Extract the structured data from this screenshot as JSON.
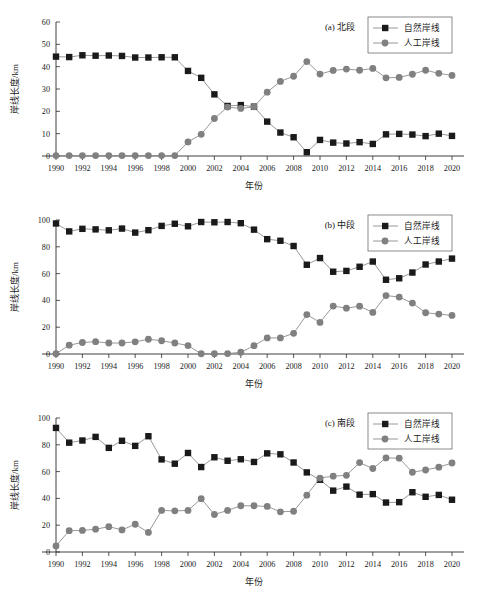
{
  "figure": {
    "panel_count": 3,
    "x_axis_title": "年份",
    "y_axis_title": "岸线长度/km",
    "legend": {
      "natural_label": "自然岸线",
      "artificial_label": "人工岸线",
      "natural_color": "#1a1a1a",
      "artificial_color": "#808080",
      "line_color": "#8c8c8c"
    }
  },
  "chart_data": [
    {
      "type": "line",
      "title": "(a) 北段",
      "xlabel": "年份",
      "ylabel": "岸线长度/km",
      "ylim": [
        0,
        60
      ],
      "yticks": [
        0,
        10,
        20,
        30,
        40,
        50,
        60
      ],
      "xlim": [
        1990,
        2020
      ],
      "xticks": [
        1990,
        1992,
        1994,
        1996,
        1998,
        2000,
        2002,
        2004,
        2006,
        2008,
        2010,
        2012,
        2014,
        2016,
        2018,
        2020
      ],
      "grid": false,
      "legend_position": "top-right",
      "x": [
        1990,
        1991,
        1992,
        1993,
        1994,
        1995,
        1996,
        1997,
        1998,
        1999,
        2000,
        2001,
        2002,
        2003,
        2004,
        2005,
        2006,
        2007,
        2008,
        2009,
        2010,
        2011,
        2012,
        2013,
        2014,
        2015,
        2016,
        2017,
        2018,
        2019,
        2020
      ],
      "series": [
        {
          "name": "自然岸线",
          "marker": "square",
          "values": [
            44.5,
            44.3,
            45.1,
            44.9,
            45.0,
            44.8,
            44.1,
            44.1,
            44.2,
            44.2,
            38.1,
            35.0,
            27.6,
            22.4,
            22.8,
            22.1,
            15.4,
            10.5,
            8.4,
            1.7,
            7.2,
            6.0,
            5.6,
            6.2,
            5.4,
            9.7,
            9.9,
            9.6,
            8.9,
            10.0,
            9.0
          ]
        },
        {
          "name": "人工岸线",
          "marker": "circle",
          "values": [
            0.2,
            0.2,
            0.2,
            0.2,
            0.2,
            0.2,
            0.2,
            0.2,
            0.2,
            0.2,
            6.3,
            9.7,
            16.8,
            21.9,
            21.3,
            22.0,
            28.6,
            33.4,
            35.7,
            42.3,
            36.7,
            38.3,
            38.9,
            38.4,
            39.2,
            35.0,
            35.2,
            36.6,
            38.4,
            37.0,
            36.1
          ]
        }
      ]
    },
    {
      "type": "line",
      "title": "(b) 中段",
      "xlabel": "年份",
      "ylabel": "岸线长度/km",
      "ylim": [
        0,
        100
      ],
      "yticks": [
        0,
        20,
        40,
        60,
        80,
        100
      ],
      "xlim": [
        1990,
        2020
      ],
      "xticks": [
        1990,
        1992,
        1994,
        1996,
        1998,
        2000,
        2002,
        2004,
        2006,
        2008,
        2010,
        2012,
        2014,
        2016,
        2018,
        2020
      ],
      "grid": false,
      "legend_position": "top-right",
      "x": [
        1990,
        1991,
        1992,
        1993,
        1994,
        1995,
        1996,
        1997,
        1998,
        1999,
        2000,
        2001,
        2002,
        2003,
        2004,
        2005,
        2006,
        2007,
        2008,
        2009,
        2010,
        2011,
        2012,
        2013,
        2014,
        2015,
        2016,
        2017,
        2018,
        2019,
        2020
      ],
      "series": [
        {
          "name": "自然岸线",
          "marker": "square",
          "values": [
            97.4,
            91.5,
            93.4,
            93.0,
            92.3,
            93.6,
            90.6,
            92.4,
            95.6,
            97.2,
            95.3,
            98.5,
            98.3,
            98.5,
            97.6,
            92.8,
            85.7,
            84.5,
            80.6,
            66.6,
            71.6,
            61.4,
            62.0,
            65.1,
            69.0,
            55.4,
            56.5,
            60.8,
            66.8,
            69.0,
            71.2
          ]
        },
        {
          "name": "人工岸线",
          "marker": "circle",
          "values": [
            0.2,
            6.6,
            8.6,
            9.2,
            8.2,
            8.2,
            9.1,
            11.0,
            9.9,
            8.2,
            6.3,
            0.2,
            0.2,
            0.3,
            1.3,
            6.2,
            12.0,
            12.0,
            15.4,
            29.4,
            23.6,
            35.8,
            34.2,
            35.7,
            31.0,
            43.6,
            42.5,
            38.0,
            30.8,
            29.8,
            28.8
          ]
        }
      ]
    },
    {
      "type": "line",
      "title": "(c) 南段",
      "xlabel": "年份",
      "ylabel": "岸线长度/km",
      "ylim": [
        0,
        100
      ],
      "yticks": [
        0,
        20,
        40,
        60,
        80,
        100
      ],
      "xlim": [
        1990,
        2020
      ],
      "xticks": [
        1990,
        1992,
        1994,
        1996,
        1998,
        2000,
        2002,
        2004,
        2006,
        2008,
        2010,
        2012,
        2014,
        2016,
        2018,
        2020
      ],
      "grid": false,
      "legend_position": "top-right",
      "x": [
        1990,
        1991,
        1992,
        1993,
        1994,
        1995,
        1996,
        1997,
        1998,
        1999,
        2000,
        2001,
        2002,
        2003,
        2004,
        2005,
        2006,
        2007,
        2008,
        2009,
        2010,
        2011,
        2012,
        2013,
        2014,
        2015,
        2016,
        2017,
        2018,
        2019,
        2020
      ],
      "series": [
        {
          "name": "自然岸线",
          "marker": "square",
          "values": [
            92.6,
            81.6,
            83.2,
            85.9,
            77.7,
            83.0,
            79.2,
            86.4,
            69.1,
            65.9,
            73.9,
            63.4,
            70.7,
            68.1,
            69.2,
            67.2,
            73.6,
            72.9,
            66.8,
            59.4,
            53.9,
            45.8,
            48.8,
            42.8,
            43.2,
            36.9,
            37.2,
            44.6,
            41.2,
            42.6,
            39.0
          ]
        },
        {
          "name": "人工岸线",
          "marker": "circle",
          "values": [
            4.5,
            15.9,
            16.1,
            17.0,
            18.9,
            16.5,
            20.7,
            14.6,
            31.0,
            30.7,
            31.0,
            39.8,
            28.0,
            31.0,
            34.5,
            34.5,
            34.0,
            30.0,
            30.4,
            42.4,
            55.2,
            56.6,
            57.2,
            66.7,
            62.3,
            70.2,
            70.0,
            59.5,
            61.2,
            63.3,
            66.4
          ]
        }
      ]
    }
  ]
}
